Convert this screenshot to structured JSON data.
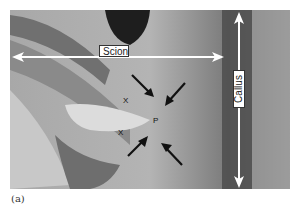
{
  "figure": {
    "panel_label": "(a)",
    "labels": {
      "scion": "Scion",
      "callus": "Callus"
    },
    "markers": {
      "xylem_upper": "X",
      "xylem_lower": "X",
      "phloem": "P"
    },
    "colors": {
      "arrow_white": "#ffffff",
      "arrow_black": "#111111",
      "tissue_dark": "#3a3a3a",
      "tissue_mid": "#8c8c8c",
      "tissue_light": "#d6d6d6"
    }
  }
}
